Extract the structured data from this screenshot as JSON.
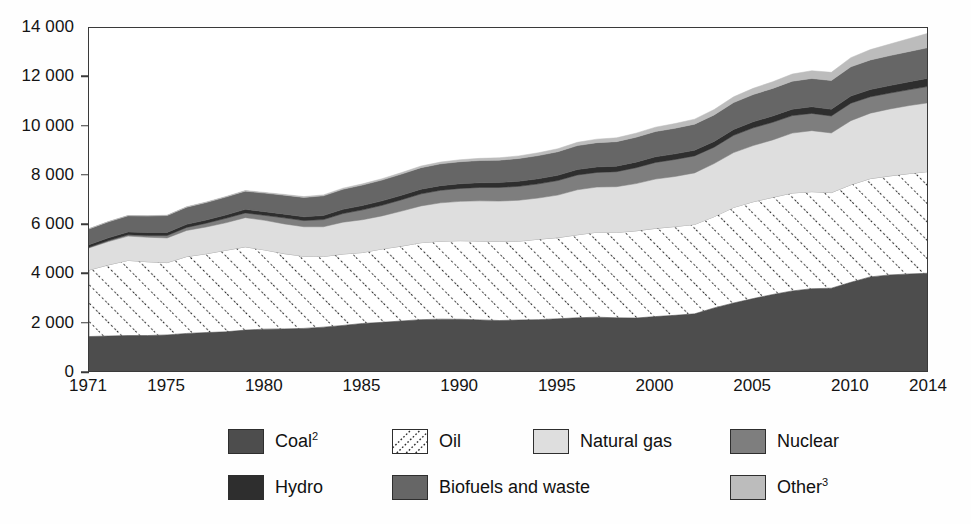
{
  "chart_data": {
    "type": "area",
    "title": "",
    "subtitle": "",
    "xlabel": "",
    "ylabel": "",
    "stacked": true,
    "grid": false,
    "legend_position": "bottom",
    "xlim": [
      1971,
      2014
    ],
    "ylim": [
      0,
      14000
    ],
    "y_ticks": [
      0,
      2000,
      4000,
      6000,
      8000,
      10000,
      12000,
      14000
    ],
    "y_tick_labels": [
      "0",
      "2 000",
      "4 000",
      "6 000",
      "8 000",
      "10 000",
      "12 000",
      "14 000"
    ],
    "x_ticks": [
      1971,
      1975,
      1980,
      1985,
      1990,
      1995,
      2000,
      2005,
      2010,
      2014
    ],
    "x_tick_labels": [
      "1971",
      "1975",
      "1980",
      "1985",
      "1990",
      "1995",
      "2000",
      "2005",
      "2010",
      "2014"
    ],
    "x": [
      1971,
      1972,
      1973,
      1974,
      1975,
      1976,
      1977,
      1978,
      1979,
      1980,
      1981,
      1982,
      1983,
      1984,
      1985,
      1986,
      1987,
      1988,
      1989,
      1990,
      1991,
      1992,
      1993,
      1994,
      1995,
      1996,
      1997,
      1998,
      1999,
      2000,
      2001,
      2002,
      2003,
      2004,
      2005,
      2006,
      2007,
      2008,
      2009,
      2010,
      2011,
      2012,
      2013,
      2014
    ],
    "series": [
      {
        "name": "Coal",
        "key": "coal",
        "color": "#4d4d4d",
        "pattern": "solid",
        "values": [
          1480,
          1500,
          1520,
          1520,
          1545,
          1605,
          1640,
          1670,
          1740,
          1780,
          1790,
          1810,
          1860,
          1930,
          2010,
          2055,
          2110,
          2165,
          2185,
          2180,
          2155,
          2130,
          2150,
          2165,
          2200,
          2240,
          2265,
          2240,
          2230,
          2290,
          2340,
          2400,
          2640,
          2840,
          3020,
          3185,
          3330,
          3420,
          3440,
          3680,
          3900,
          3980,
          4020,
          4050
        ]
      },
      {
        "name": "Oil",
        "key": "oil",
        "color": "#ffffff",
        "pattern": "diagonal-dotted-hatch",
        "values": [
          2700,
          2890,
          3050,
          2995,
          2935,
          3120,
          3200,
          3310,
          3380,
          3215,
          3055,
          2930,
          2870,
          2900,
          2880,
          2980,
          3040,
          3125,
          3165,
          3190,
          3200,
          3215,
          3200,
          3265,
          3295,
          3370,
          3450,
          3465,
          3540,
          3580,
          3605,
          3630,
          3705,
          3880,
          3930,
          3945,
          3975,
          3940,
          3880,
          3960,
          3990,
          4020,
          4075,
          4130
        ]
      },
      {
        "name": "Natural gas",
        "key": "natural_gas",
        "color": "#dedede",
        "pattern": "solid",
        "values": [
          895,
          945,
          985,
          995,
          1000,
          1060,
          1085,
          1115,
          1185,
          1200,
          1205,
          1195,
          1205,
          1290,
          1330,
          1340,
          1420,
          1490,
          1555,
          1595,
          1630,
          1630,
          1660,
          1670,
          1725,
          1825,
          1830,
          1855,
          1915,
          2000,
          2030,
          2090,
          2155,
          2225,
          2280,
          2330,
          2430,
          2475,
          2420,
          2600,
          2655,
          2715,
          2760,
          2790
        ]
      },
      {
        "name": "Nuclear",
        "key": "nuclear",
        "color": "#7e7e7e",
        "pattern": "solid",
        "values": [
          29,
          42,
          54,
          72,
          100,
          122,
          154,
          180,
          190,
          202,
          245,
          250,
          290,
          350,
          400,
          430,
          460,
          490,
          510,
          525,
          545,
          555,
          565,
          575,
          590,
          600,
          595,
          610,
          645,
          675,
          690,
          690,
          665,
          700,
          720,
          715,
          710,
          700,
          690,
          710,
          665,
          645,
          645,
          665
        ]
      },
      {
        "name": "Hydro",
        "key": "hydro",
        "color": "#2e2e2e",
        "pattern": "solid",
        "values": [
          104,
          110,
          112,
          120,
          125,
          128,
          130,
          138,
          145,
          148,
          152,
          155,
          165,
          172,
          177,
          180,
          182,
          188,
          188,
          190,
          192,
          197,
          205,
          208,
          214,
          222,
          223,
          224,
          227,
          230,
          228,
          232,
          232,
          240,
          245,
          255,
          260,
          268,
          275,
          290,
          295,
          305,
          320,
          330
        ]
      },
      {
        "name": "Biofuels and waste",
        "key": "biofuels_and_waste",
        "color": "#666666",
        "pattern": "solid",
        "values": [
          640,
          650,
          660,
          670,
          685,
          695,
          710,
          725,
          740,
          755,
          770,
          785,
          800,
          815,
          830,
          845,
          860,
          875,
          885,
          895,
          900,
          910,
          925,
          940,
          955,
          970,
          985,
          995,
          1010,
          1025,
          1040,
          1055,
          1075,
          1090,
          1105,
          1120,
          1135,
          1150,
          1165,
          1185,
          1200,
          1215,
          1230,
          1245
        ]
      },
      {
        "name": "Other",
        "key": "other",
        "color": "#bcbcbc",
        "pattern": "solid",
        "values": [
          8,
          9,
          10,
          12,
          14,
          16,
          18,
          21,
          24,
          27,
          30,
          34,
          38,
          43,
          48,
          54,
          60,
          66,
          72,
          80,
          88,
          96,
          104,
          113,
          122,
          132,
          142,
          153,
          164,
          176,
          189,
          203,
          218,
          234,
          251,
          270,
          291,
          313,
          330,
          372,
          418,
          470,
          525,
          585
        ]
      }
    ],
    "totals_note": "Stacked total world total primary energy supply (Mtoe)"
  },
  "legend": {
    "rows": [
      [
        {
          "label": "Coal",
          "sup": "2",
          "swatch_class": "sw-coal",
          "name": "coal"
        },
        {
          "label": "Oil",
          "sup": "",
          "swatch_class": "sw-oil",
          "name": "oil"
        },
        {
          "label": "Natural gas",
          "sup": "",
          "swatch_class": "sw-gas",
          "name": "natural-gas"
        },
        {
          "label": "Nuclear",
          "sup": "",
          "swatch_class": "sw-nuclear",
          "name": "nuclear"
        }
      ],
      [
        {
          "label": "Hydro",
          "sup": "",
          "swatch_class": "sw-hydro",
          "name": "hydro"
        },
        {
          "label": "Biofuels and waste",
          "sup": "",
          "swatch_class": "sw-biofuels",
          "name": "biofuels-and-waste"
        },
        {
          "label": "Other",
          "sup": "3",
          "swatch_class": "sw-other",
          "name": "other"
        }
      ]
    ]
  },
  "colors": {
    "coal": "#4d4d4d",
    "oil": "#ffffff",
    "natural_gas": "#dedede",
    "nuclear": "#7e7e7e",
    "hydro": "#2e2e2e",
    "biofuels_and_waste": "#666666",
    "other": "#bcbcbc",
    "axis": "#3a3a3a",
    "text": "#141414",
    "background": "#ffffff"
  }
}
